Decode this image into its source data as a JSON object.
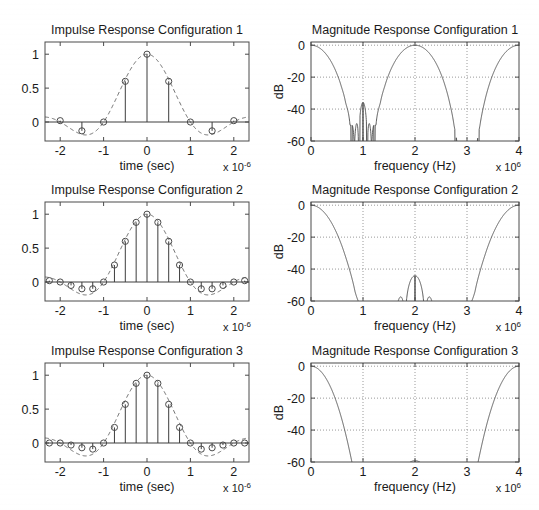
{
  "figure": {
    "background": "#ffffff",
    "width": 539,
    "height": 510,
    "line_color": "#4a4a4a",
    "grid_color": "#9a9a9a"
  },
  "panels": [
    {
      "id": "impulse-1",
      "title": "Impulse Response Configuration 1",
      "xlabel": "time (sec)",
      "ylabel": "",
      "x_exponent_prefix": "x 10",
      "x_exponent_power": "-6",
      "xticks": [
        -2,
        -1,
        0,
        1,
        2
      ],
      "xticklabels": [
        "-2",
        "-1",
        "0",
        "1",
        "2"
      ],
      "yticks": [
        0,
        0.5,
        1
      ],
      "yticklabels": [
        "0",
        "0.5",
        "1"
      ],
      "xlim": [
        -2.35,
        2.35
      ],
      "ylim": [
        -0.28,
        1.18
      ],
      "grid": false
    },
    {
      "id": "magnitude-1",
      "title": "Magnitude Response Configuration 1",
      "xlabel": "frequency (Hz)",
      "ylabel": "dB",
      "x_exponent_prefix": "x 10",
      "x_exponent_power": "6",
      "xticks": [
        0,
        1,
        2,
        3,
        4
      ],
      "xticklabels": [
        "0",
        "1",
        "2",
        "3",
        "4"
      ],
      "yticks": [
        -60,
        -40,
        -20,
        0
      ],
      "yticklabels": [
        "-60",
        "-40",
        "-20",
        "0"
      ],
      "xlim": [
        0,
        4
      ],
      "ylim": [
        -60,
        2
      ],
      "grid": true
    },
    {
      "id": "impulse-2",
      "title": "Impulse Response Configuration 2",
      "xlabel": "time (sec)",
      "ylabel": "",
      "x_exponent_prefix": "x 10",
      "x_exponent_power": "-6",
      "xticks": [
        -2,
        -1,
        0,
        1,
        2
      ],
      "xticklabels": [
        "-2",
        "-1",
        "0",
        "1",
        "2"
      ],
      "yticks": [
        0,
        0.5,
        1
      ],
      "yticklabels": [
        "0",
        "0.5",
        "1"
      ],
      "xlim": [
        -2.35,
        2.35
      ],
      "ylim": [
        -0.28,
        1.18
      ],
      "grid": false
    },
    {
      "id": "magnitude-2",
      "title": "Magnitude Response Configuration 2",
      "xlabel": "frequency (Hz)",
      "ylabel": "dB",
      "x_exponent_prefix": "x 10",
      "x_exponent_power": "6",
      "xticks": [
        0,
        1,
        2,
        3,
        4
      ],
      "xticklabels": [
        "0",
        "1",
        "2",
        "3",
        "4"
      ],
      "yticks": [
        -60,
        -40,
        -20,
        0
      ],
      "yticklabels": [
        "-60",
        "-40",
        "-20",
        "0"
      ],
      "xlim": [
        0,
        4
      ],
      "ylim": [
        -60,
        2
      ],
      "grid": true
    },
    {
      "id": "impulse-3",
      "title": "Impulse Response Configuration 3",
      "xlabel": "time (sec)",
      "ylabel": "",
      "x_exponent_prefix": "x 10",
      "x_exponent_power": "-6",
      "xticks": [
        -2,
        -1,
        0,
        1,
        2
      ],
      "xticklabels": [
        "-2",
        "-1",
        "0",
        "1",
        "2"
      ],
      "yticks": [
        0,
        0.5,
        1
      ],
      "yticklabels": [
        "0",
        "0.5",
        "1"
      ],
      "xlim": [
        -2.35,
        2.35
      ],
      "ylim": [
        -0.28,
        1.18
      ],
      "grid": false
    },
    {
      "id": "magnitude-3",
      "title": "Magnitude Response Configuration 3",
      "xlabel": "frequency (Hz)",
      "ylabel": "dB",
      "x_exponent_prefix": "x 10",
      "x_exponent_power": "6",
      "xticks": [
        0,
        1,
        2,
        3,
        4
      ],
      "xticklabels": [
        "0",
        "1",
        "2",
        "3",
        "4"
      ],
      "yticks": [
        -60,
        -40,
        -20,
        0
      ],
      "yticklabels": [
        "-60",
        "-40",
        "-20",
        "0"
      ],
      "xlim": [
        0,
        4
      ],
      "ylim": [
        -60,
        2
      ],
      "grid": true
    }
  ],
  "chart_data": [
    {
      "id": "impulse-1",
      "type": "line",
      "title": "Impulse Response Configuration 1",
      "xlabel": "time (sec)",
      "ylabel": "",
      "xlim": [
        -2.35,
        2.35
      ],
      "ylim": [
        -0.28,
        1.18
      ],
      "x_scale": 1e-06,
      "grid": false,
      "series": [
        {
          "name": "stem samples",
          "style": "stem-with-circle-markers",
          "sample_interval": 0.5,
          "x": [
            -2.0,
            -1.5,
            -1.0,
            -0.5,
            0.0,
            0.5,
            1.0,
            1.5,
            2.0
          ],
          "values": [
            0.02,
            -0.13,
            0.0,
            0.6,
            1.0,
            0.6,
            0.0,
            -0.13,
            0.02
          ]
        },
        {
          "name": "sinc envelope",
          "style": "dashed",
          "description": "windowed sinc envelope through sample points, zero crossings at +-1e-6 and +-2e-6, minima -0.13 at +-1.5e-6"
        }
      ]
    },
    {
      "id": "magnitude-1",
      "type": "line",
      "title": "Magnitude Response Configuration 1",
      "xlabel": "frequency (Hz)",
      "ylabel": "dB",
      "xlim": [
        0,
        4
      ],
      "ylim": [
        -60,
        2
      ],
      "x_scale": 1000000.0,
      "grid": true,
      "series": [
        {
          "name": "magnitude",
          "style": "solid",
          "passbands": [
            [
              0,
              0.45
            ],
            [
              1.75,
              2.25
            ],
            [
              3.55,
              4.0
            ]
          ],
          "stopband_centers": [
            1.0,
            3.0
          ],
          "stopband_level_db": -36,
          "null_frequencies": [
            0.78,
            0.93,
            1.08,
            1.22,
            2.78,
            2.93,
            3.08,
            3.22
          ],
          "description": "Three passband lobes around 0, 2 and 4 MHz; two stopbands centred at 1 and 3 MHz with side lobes peaking near -36 dB"
        }
      ]
    },
    {
      "id": "impulse-2",
      "type": "line",
      "title": "Impulse Response Configuration 2",
      "xlabel": "time (sec)",
      "ylabel": "",
      "xlim": [
        -2.35,
        2.35
      ],
      "ylim": [
        -0.28,
        1.18
      ],
      "x_scale": 1e-06,
      "grid": false,
      "series": [
        {
          "name": "stem samples",
          "style": "stem-with-circle-markers",
          "sample_interval": 0.25,
          "x": [
            -2.25,
            -2.0,
            -1.75,
            -1.5,
            -1.25,
            -1.0,
            -0.75,
            -0.5,
            -0.25,
            0.0,
            0.25,
            0.5,
            0.75,
            1.0,
            1.25,
            1.5,
            1.75,
            2.0,
            2.25
          ],
          "values": [
            0.02,
            0.0,
            -0.05,
            -0.1,
            -0.1,
            0.0,
            0.25,
            0.6,
            0.88,
            1.0,
            0.88,
            0.6,
            0.25,
            0.0,
            -0.1,
            -0.1,
            -0.05,
            0.0,
            0.02
          ]
        },
        {
          "name": "sinc envelope",
          "style": "dashed",
          "description": "windowed sinc envelope through sample points"
        }
      ]
    },
    {
      "id": "magnitude-2",
      "type": "line",
      "title": "Magnitude Response Configuration 2",
      "xlabel": "frequency (Hz)",
      "ylabel": "dB",
      "xlim": [
        0,
        4
      ],
      "ylim": [
        -60,
        2
      ],
      "x_scale": 1000000.0,
      "grid": true,
      "series": [
        {
          "name": "magnitude",
          "style": "solid",
          "passbands": [
            [
              0,
              0.45
            ],
            [
              3.55,
              4.0
            ]
          ],
          "stopband_range": [
            0.72,
            3.28
          ],
          "stopband_level_db": -44,
          "ripple_count": 12,
          "description": "Lowpass with single stopband from about 0.7 to 3.3 MHz, roughly 12 ripples peaking near -44 dB"
        }
      ]
    },
    {
      "id": "impulse-3",
      "type": "line",
      "title": "Impulse Response Configuration 3",
      "xlabel": "time (sec)",
      "ylabel": "",
      "xlim": [
        -2.35,
        2.35
      ],
      "ylim": [
        -0.28,
        1.18
      ],
      "x_scale": 1e-06,
      "grid": false,
      "series": [
        {
          "name": "stem samples",
          "style": "stem-with-circle-markers",
          "sample_interval": 0.25,
          "x": [
            -2.25,
            -2.0,
            -1.75,
            -1.5,
            -1.25,
            -1.0,
            -0.75,
            -0.5,
            -0.25,
            0.0,
            0.25,
            0.5,
            0.75,
            1.0,
            1.25,
            1.5,
            1.75,
            2.0,
            2.25
          ],
          "values": [
            0.0,
            0.0,
            -0.03,
            -0.07,
            -0.09,
            0.0,
            0.23,
            0.57,
            0.88,
            1.0,
            0.88,
            0.57,
            0.23,
            0.0,
            -0.09,
            -0.07,
            -0.03,
            0.0,
            0.0
          ]
        },
        {
          "name": "sinc envelope",
          "style": "dashed",
          "description": "windowed sinc envelope through sample points"
        }
      ]
    },
    {
      "id": "magnitude-3",
      "type": "line",
      "title": "Magnitude Response Configuration 3",
      "xlabel": "frequency (Hz)",
      "ylabel": "dB",
      "xlim": [
        0,
        4
      ],
      "ylim": [
        -60,
        2
      ],
      "x_scale": 1000000.0,
      "grid": true,
      "series": [
        {
          "name": "magnitude",
          "style": "solid",
          "passbands": [
            [
              0,
              0.42
            ],
            [
              3.58,
              4.0
            ]
          ],
          "stopband_range": [
            0.8,
            3.2
          ],
          "stopband_level_db": -50,
          "ripple_count": 4,
          "description": "Lowpass with deep stopband; small side lobes near 0.9 and 3.1 MHz reaching about -50 dB, otherwise below -60 dB"
        }
      ]
    }
  ]
}
